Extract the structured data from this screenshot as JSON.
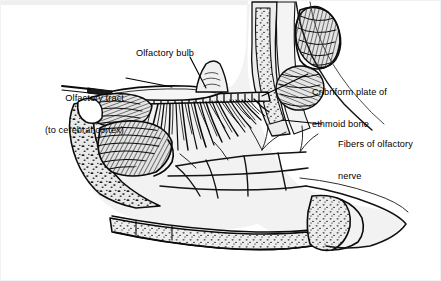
{
  "figure": {
    "background_color": "#ffffff",
    "ink_color": "#000000",
    "bone_fill": "#e8e8e8",
    "tissue_fill": "#efefef",
    "cavity_fill": "#ffffff"
  },
  "labels": {
    "olfactory_bulb": "Olfactory bulb",
    "olfactory_tract_line1": "Olfactory tract",
    "olfactory_tract_line2": "(to cerebral cortex)",
    "cribriform_line1": "Cribriform plate of",
    "cribriform_line2": "ethmoid bone",
    "fibers_line1": "Fibers of olfactory",
    "fibers_line2": "nerve"
  },
  "structures": [
    {
      "name": "olfactory-bulb",
      "side": "superior",
      "description": "elongated ovoid body resting on cribriform plate"
    },
    {
      "name": "olfactory-tract",
      "side": "posterior",
      "description": "slender stalk running posteriorly to cerebral cortex"
    },
    {
      "name": "cribriform-plate",
      "side": "superior",
      "description": "perforated horizontal plate of ethmoid bone"
    },
    {
      "name": "olfactory-nerve-fibers",
      "side": "inferior",
      "description": "radiating filaments descending into nasal mucosa"
    },
    {
      "name": "superior-concha",
      "side": "lateral-wall",
      "description": "hatched scroll of bone"
    },
    {
      "name": "middle-concha",
      "side": "lateral-wall",
      "description": "hatched scroll of bone"
    },
    {
      "name": "inferior-concha",
      "side": "lateral-wall",
      "description": "large hatched scroll of bone"
    },
    {
      "name": "frontal-sinus",
      "side": "anterior-superior",
      "description": "air cavity with hatched lining"
    },
    {
      "name": "sphenoid-sinus",
      "side": "posterior-superior",
      "description": "air cavity with hatched lining"
    },
    {
      "name": "hard-palate",
      "side": "inferior",
      "description": "stippled cancellous bone floor of nasal cavity"
    },
    {
      "name": "nasal-septum",
      "side": "medial",
      "description": "light tissue plane with branching vessels"
    }
  ]
}
